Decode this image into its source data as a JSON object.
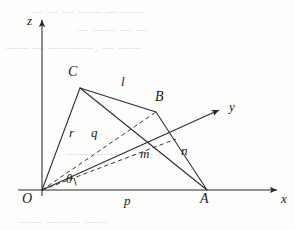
{
  "figure": {
    "stroke_color": "#2b2b2b",
    "background_color": "#fdfdfb",
    "axes": [
      {
        "name": "z",
        "label": "z",
        "direction": "up"
      },
      {
        "name": "x",
        "label": "x",
        "direction": "right"
      },
      {
        "name": "y",
        "label": "y",
        "direction": "diagonal-up-right"
      }
    ],
    "points": [
      {
        "name": "O",
        "label": "O",
        "x": 42,
        "y": 190,
        "label_x": 22,
        "label_y": 194
      },
      {
        "name": "A",
        "label": "A",
        "x": 207,
        "y": 190,
        "label_x": 200,
        "label_y": 194
      },
      {
        "name": "B",
        "label": "B",
        "x": 156,
        "y": 112,
        "label_x": 155,
        "label_y": 92
      },
      {
        "name": "C",
        "label": "C",
        "x": 80,
        "y": 88,
        "label_x": 68,
        "label_y": 66
      }
    ],
    "segments": [
      {
        "name": "OC",
        "label": "r",
        "style": "solid",
        "label_x": 69,
        "label_y": 127
      },
      {
        "name": "OB",
        "label": "q",
        "style": "dashed",
        "label_x": 91,
        "label_y": 127
      },
      {
        "name": "Om",
        "label": "m",
        "style": "dashed",
        "label_x": 141,
        "label_y": 148
      },
      {
        "name": "OA",
        "label": "p",
        "style": "solid",
        "label_x": 124,
        "label_y": 195
      },
      {
        "name": "CB",
        "label": "l",
        "style": "solid",
        "label_x": 121,
        "label_y": 77
      },
      {
        "name": "BA",
        "label": "n",
        "style": "solid",
        "label_x": 181,
        "label_y": 145
      },
      {
        "name": "CA",
        "label": "",
        "style": "solid",
        "label_x": 0,
        "label_y": 0
      }
    ],
    "angle": {
      "name": "theta",
      "label": "θ",
      "label_x": 65,
      "label_y": 175
    }
  },
  "watermark": {
    "lines": [
      {
        "text": "— —  — —— —  ——",
        "x": 32,
        "y": 6
      },
      {
        "text": "— —— —  —",
        "x": 78,
        "y": 24
      },
      {
        "text": "—— —  ————, — ——",
        "x": 6,
        "y": 42
      },
      {
        "text": "——  ——— —— —",
        "x": 66,
        "y": 148
      },
      {
        "text": "—— ———  ——",
        "x": 20,
        "y": 216
      }
    ]
  }
}
